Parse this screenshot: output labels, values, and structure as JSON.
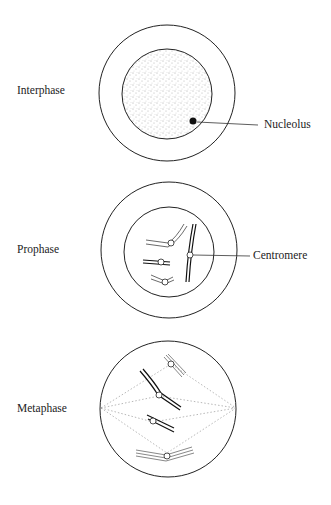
{
  "diagram": {
    "title": "",
    "stages": [
      {
        "label": "Interphase",
        "annotation": "Nucleolus"
      },
      {
        "label": "Prophase",
        "annotation": "Centromere"
      },
      {
        "label": "Metaphase"
      }
    ]
  }
}
